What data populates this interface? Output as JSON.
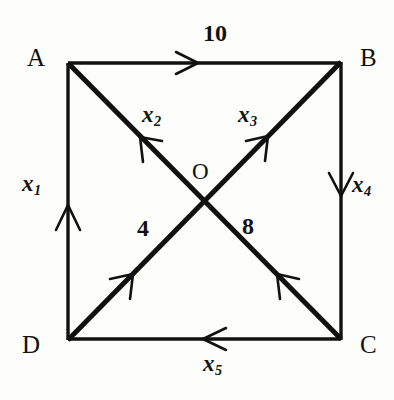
{
  "figure": {
    "background_color": "#fdfdfc",
    "line_color": "#111111"
  },
  "nodes": [
    {
      "id": "A",
      "label": "A",
      "x": 68,
      "y": 63,
      "label_x": 27,
      "label_y": 45
    },
    {
      "id": "B",
      "label": "B",
      "x": 341,
      "y": 62,
      "label_x": 360,
      "label_y": 45
    },
    {
      "id": "C",
      "label": "C",
      "x": 341,
      "y": 339,
      "label_x": 360,
      "label_y": 332
    },
    {
      "id": "D",
      "label": "D",
      "x": 68,
      "y": 340,
      "label_x": 22,
      "label_y": 332
    },
    {
      "id": "O",
      "label": "O",
      "x": 204,
      "y": 200,
      "label_x": 192,
      "label_y": 160
    }
  ],
  "edges": [
    {
      "name": "edge-a-b",
      "from": "A",
      "to": "B",
      "label": "10",
      "label_x": 203,
      "label_y": 21,
      "label_type": "weight",
      "direction": "A to B"
    },
    {
      "name": "edge-o-a",
      "from": "O",
      "to": "A",
      "label": "x",
      "sub": "2",
      "label_x": 142,
      "label_y": 103,
      "label_type": "variable",
      "direction": "O to A"
    },
    {
      "name": "edge-o-b",
      "from": "O",
      "to": "B",
      "label": "x",
      "sub": "3",
      "label_x": 238,
      "label_y": 103,
      "label_type": "variable",
      "direction": "O to B"
    },
    {
      "name": "edge-d-a",
      "from": "D",
      "to": "A",
      "label": "x",
      "sub": "1",
      "label_x": 22,
      "label_y": 172,
      "label_type": "variable",
      "direction": "D to A"
    },
    {
      "name": "edge-b-c",
      "from": "B",
      "to": "C",
      "label": "x",
      "sub": "4",
      "label_x": 352,
      "label_y": 173,
      "label_type": "variable",
      "direction": "B to C"
    },
    {
      "name": "edge-d-o",
      "from": "D",
      "to": "O",
      "label": "4",
      "label_x": 137,
      "label_y": 216,
      "label_type": "weight",
      "direction": "D to O"
    },
    {
      "name": "edge-c-o",
      "from": "C",
      "to": "O",
      "label": "8",
      "label_x": 242,
      "label_y": 214,
      "label_type": "weight",
      "direction": "C to O"
    },
    {
      "name": "edge-c-d",
      "from": "C",
      "to": "D",
      "label": "x",
      "sub": "5",
      "label_x": 203,
      "label_y": 352,
      "label_type": "variable",
      "direction": "C to D"
    }
  ]
}
